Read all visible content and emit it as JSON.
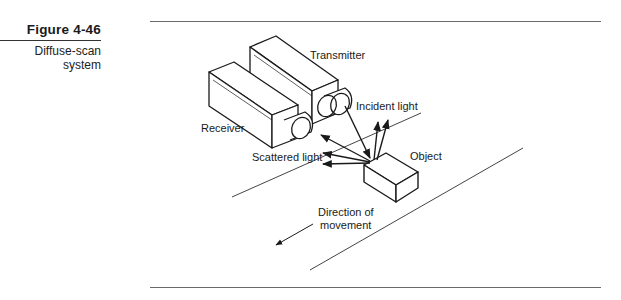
{
  "figure": {
    "number": "Figure  4-46",
    "title_line1": "Diffuse-scan",
    "title_line2": "system"
  },
  "diagram": {
    "labels": {
      "transmitter": "Transmitter",
      "receiver": "Receiver",
      "incident_light": "Incident light",
      "scattered_light": "Scattered light",
      "object": "Object",
      "direction_line1": "Direction of",
      "direction_line2": "movement"
    },
    "colors": {
      "stroke": "#1a1a1a",
      "road": "#444444",
      "rule": "#6a6a6a"
    }
  }
}
